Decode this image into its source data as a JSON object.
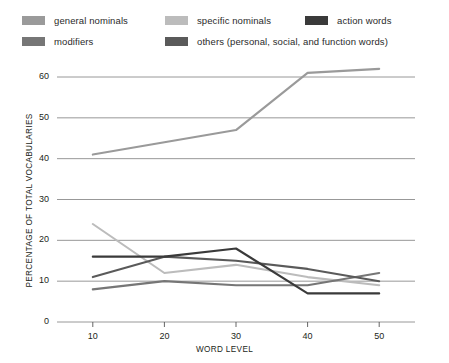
{
  "chart_data": {
    "type": "line",
    "title": "",
    "xlabel": "WORD LEVEL",
    "ylabel": "PERCENTAGE OF TOTAL VOCABULARIES",
    "x": [
      10,
      20,
      30,
      40,
      50
    ],
    "xtick_labels": [
      "10",
      "20",
      "30",
      "40",
      "50"
    ],
    "ytick_labels": [
      "0",
      "10",
      "20",
      "30",
      "40",
      "50",
      "60"
    ],
    "yticks": [
      0,
      10,
      20,
      30,
      40,
      50,
      60
    ],
    "xlim": [
      5,
      55
    ],
    "ylim": [
      0,
      65
    ],
    "grid": "horizontal",
    "legend_position": "top",
    "series": [
      {
        "name": "general nominals",
        "color": "#9a9a9a",
        "values": [
          41,
          44,
          47,
          61,
          62
        ]
      },
      {
        "name": "specific nominals",
        "color": "#bcbcbc",
        "values": [
          24,
          12,
          14,
          11,
          9
        ]
      },
      {
        "name": "action words",
        "color": "#3a3a3a",
        "values": [
          16,
          16,
          18,
          7,
          7
        ]
      },
      {
        "name": "modifiers",
        "color": "#767676",
        "values": [
          8,
          10,
          9,
          9,
          12
        ]
      },
      {
        "name": "others (personal, social, and function words)",
        "color": "#5a5a5a",
        "values": [
          11,
          16,
          15,
          13,
          10
        ]
      }
    ]
  },
  "legend": {
    "items": [
      {
        "label": "general nominals",
        "color": "#9a9a9a"
      },
      {
        "label": "specific nominals",
        "color": "#bcbcbc"
      },
      {
        "label": "action words",
        "color": "#3a3a3a"
      },
      {
        "label": "modifiers",
        "color": "#767676"
      },
      {
        "label": "others (personal, social, and function words)",
        "color": "#5a5a5a"
      }
    ]
  },
  "axes": {
    "y_title": "PERCENTAGE OF TOTAL VOCABULARIES",
    "x_title": "WORD LEVEL",
    "y_ticks": [
      "60",
      "50",
      "40",
      "30",
      "20",
      "10",
      "0"
    ],
    "x_ticks": [
      "10",
      "20",
      "30",
      "40",
      "50"
    ]
  },
  "style": {
    "grid_color": "#8c8c8c",
    "axis_color": "#555555",
    "text_color": "#231f20",
    "background": "#ffffff"
  }
}
